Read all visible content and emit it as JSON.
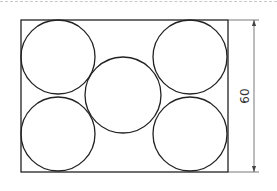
{
  "diagram": {
    "stroke_color": "#222222",
    "dimension_color": "#555555",
    "rectangle": {
      "x": 21,
      "y": 20,
      "width": 207,
      "height": 152
    },
    "circles": [
      {
        "name": "top-left-circle",
        "cx": 58,
        "cy": 57,
        "r": 37
      },
      {
        "name": "bottom-left-circle",
        "cx": 58,
        "cy": 134,
        "r": 37
      },
      {
        "name": "center-circle",
        "cx": 123,
        "cy": 95,
        "r": 38
      },
      {
        "name": "top-right-circle",
        "cx": 190,
        "cy": 57,
        "r": 37
      },
      {
        "name": "bottom-right-circle",
        "cx": 190,
        "cy": 134,
        "r": 37
      }
    ],
    "dimension": {
      "label": "60",
      "x": 254,
      "y_top": 20,
      "y_bottom": 172
    }
  }
}
